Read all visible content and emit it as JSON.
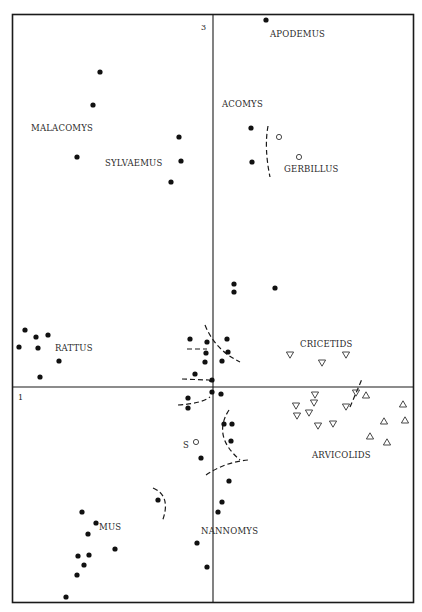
{
  "chart_data": {
    "type": "scatter",
    "title": "",
    "xlabel": "1",
    "ylabel": "3",
    "axis_labels": {
      "horizontal_axis": "1",
      "vertical_axis": "3"
    },
    "grid": false,
    "legend": null,
    "frame": {
      "left": 12,
      "top": 14,
      "right": 413,
      "bottom": 602
    },
    "axes_origin_px": {
      "x": 213,
      "y": 387
    },
    "series": [
      {
        "name": "murids (filled circles)",
        "marker": "filled-circle",
        "points": [
          [
            266,
            20
          ],
          [
            100,
            72
          ],
          [
            93,
            105
          ],
          [
            77,
            157
          ],
          [
            179,
            137
          ],
          [
            181,
            161
          ],
          [
            171,
            182
          ],
          [
            251,
            128
          ],
          [
            252,
            162
          ],
          [
            234,
            284
          ],
          [
            234,
            292
          ],
          [
            275,
            288
          ],
          [
            25,
            330
          ],
          [
            36,
            337
          ],
          [
            48,
            335
          ],
          [
            19,
            347
          ],
          [
            38,
            348
          ],
          [
            59,
            361
          ],
          [
            40,
            377
          ],
          [
            190,
            339
          ],
          [
            207,
            342
          ],
          [
            227,
            339
          ],
          [
            206,
            353
          ],
          [
            228,
            352
          ],
          [
            205,
            362
          ],
          [
            222,
            361
          ],
          [
            195,
            374
          ],
          [
            212,
            392
          ],
          [
            221,
            394
          ],
          [
            188,
            398
          ],
          [
            212,
            380
          ],
          [
            188,
            408
          ],
          [
            224,
            424
          ],
          [
            232,
            424
          ],
          [
            231,
            441
          ],
          [
            201,
            458
          ],
          [
            229,
            481
          ],
          [
            158,
            500
          ],
          [
            222,
            502
          ],
          [
            218,
            512
          ],
          [
            82,
            512
          ],
          [
            96,
            523
          ],
          [
            88,
            534
          ],
          [
            115,
            549
          ],
          [
            78,
            556
          ],
          [
            89,
            555
          ],
          [
            84,
            565
          ],
          [
            77,
            575
          ],
          [
            197,
            543
          ],
          [
            207,
            567
          ],
          [
            66,
            597
          ]
        ]
      },
      {
        "name": "gerbils / S (open circles)",
        "marker": "open-circle",
        "points": [
          [
            279,
            137
          ],
          [
            299,
            157
          ],
          [
            196,
            442
          ]
        ]
      },
      {
        "name": "CRICETIDS",
        "marker": "down-triangle",
        "points": [
          [
            290,
            355
          ],
          [
            322,
            363
          ],
          [
            346,
            355
          ],
          [
            315,
            395
          ],
          [
            296,
            406
          ],
          [
            314,
            403
          ],
          [
            309,
            413
          ],
          [
            297,
            416
          ],
          [
            346,
            407
          ],
          [
            318,
            426
          ],
          [
            333,
            424
          ],
          [
            356,
            393
          ]
        ]
      },
      {
        "name": "ARVICOLIDS",
        "marker": "up-triangle",
        "points": [
          [
            366,
            395
          ],
          [
            403,
            404
          ],
          [
            384,
            421
          ],
          [
            405,
            420
          ],
          [
            370,
            436
          ],
          [
            387,
            442
          ]
        ]
      }
    ],
    "annotations": [
      {
        "text": "APODEMUS",
        "x": 270,
        "y": 37
      },
      {
        "text": "ACOMYS",
        "x": 222,
        "y": 107
      },
      {
        "text": "MALACOMYS",
        "x": 31,
        "y": 131
      },
      {
        "text": "SYLVAEMUS",
        "x": 105,
        "y": 166
      },
      {
        "text": "GERBILLUS",
        "x": 284,
        "y": 172
      },
      {
        "text": "RATTUS",
        "x": 55,
        "y": 351
      },
      {
        "text": "CRICETIDS",
        "x": 300,
        "y": 347
      },
      {
        "text": "ARVICOLIDS",
        "x": 312,
        "y": 458
      },
      {
        "text": "S",
        "x": 183,
        "y": 448
      },
      {
        "text": "MUS",
        "x": 99,
        "y": 530
      },
      {
        "text": "NANNOMYS",
        "x": 201,
        "y": 534
      }
    ],
    "boundaries": [
      {
        "type": "dashed",
        "path": "M268,126 Q264,148 270,177"
      },
      {
        "type": "dashed",
        "path": "M205,325 Q215,350 240,362"
      },
      {
        "type": "dashed",
        "path": "M187,349 L207,349"
      },
      {
        "type": "dashed",
        "path": "M182,379 L209,380 L212,384"
      },
      {
        "type": "dashed",
        "path": "M178,405 Q200,404 210,397"
      },
      {
        "type": "dashed",
        "path": "M350,407 L362,379"
      },
      {
        "type": "dashed",
        "path": "M229,410 Q212,436 240,460"
      },
      {
        "type": "dashed",
        "path": "M206,475 Q225,462 248,460"
      },
      {
        "type": "dashed",
        "path": "M153,488 Q172,496 162,522"
      }
    ]
  }
}
